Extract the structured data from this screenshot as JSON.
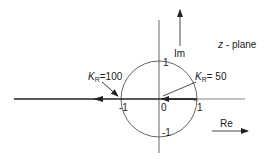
{
  "diagram": {
    "plane_label": "z - plane",
    "imag_axis_label": "Im",
    "real_axis_label": "Re",
    "ticks": {
      "origin": "0",
      "re_pos": "1",
      "re_neg": "-1",
      "im_pos": "1",
      "im_neg": "-1"
    },
    "annotations": [
      {
        "symbol": "K",
        "subscript": "R",
        "eq": "=100",
        "points_to": "-1"
      },
      {
        "symbol": "K",
        "subscript": "R",
        "eq": "= 50",
        "points_to": "1"
      }
    ],
    "colors": {
      "line": "#333333",
      "circle": "#555555"
    }
  }
}
